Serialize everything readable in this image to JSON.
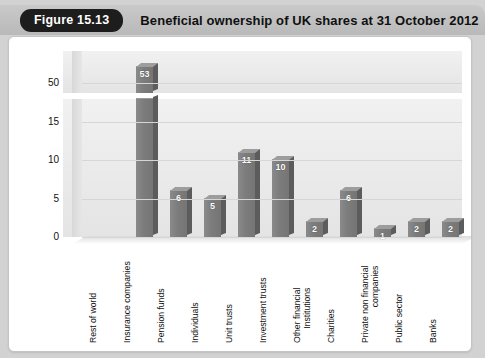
{
  "header": {
    "badge": "Figure 15.13",
    "title": "Beneficial ownership of UK shares at 31 October 2012"
  },
  "chart_data": {
    "type": "bar",
    "title": "Beneficial ownership of UK shares at 31 October 2012",
    "xlabel": "",
    "ylabel": "Percentage of UK stock market owned by value",
    "grid": true,
    "legend": "none",
    "broken_axis": true,
    "lower_ticks": [
      "0",
      "5",
      "10",
      "15"
    ],
    "upper_ticks": [
      "50"
    ],
    "lower_ylim": [
      0,
      18
    ],
    "upper_ylim": [
      48,
      56
    ],
    "categories": [
      "Rest of world",
      "Insurance companies",
      "Pension funds",
      "Individuals",
      "Unit trusts",
      "Investment trusts",
      "Other financial Institutions",
      "Charities",
      "Private non financial companies",
      "Public sector",
      "Banks"
    ],
    "category_lines": [
      [
        "Rest of world"
      ],
      [
        "Insurance companies"
      ],
      [
        "Pension funds"
      ],
      [
        "Individuals"
      ],
      [
        "Unit trusts"
      ],
      [
        "Investment trusts"
      ],
      [
        "Other financial",
        "Institutions"
      ],
      [
        "Charities"
      ],
      [
        "Private non financial",
        "companies"
      ],
      [
        "Public sector"
      ],
      [
        "Banks"
      ]
    ],
    "values": [
      53,
      6,
      5,
      11,
      10,
      2,
      6,
      1,
      2,
      2,
      2
    ],
    "value_labels": [
      "53",
      "6",
      "5",
      "11",
      "10",
      "2",
      "6",
      "1",
      "2",
      "2",
      "2"
    ],
    "bar_color": "#7c7c7c",
    "bar_side_color": "#5c5c5c",
    "plot_background": "#eaeaea",
    "label_color": "#ffffff"
  }
}
